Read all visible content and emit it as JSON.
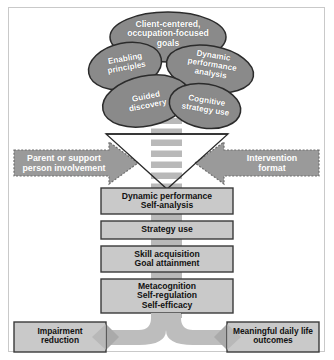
{
  "figure": {
    "colors": {
      "ellipse_fill": "#8a8a8a",
      "ellipse_stroke": "#2b2b2b",
      "box_fill": "#c9c9c9",
      "box_stroke": "#3a3a3a",
      "arrow_fill": "#9a9a9a",
      "arrow_stroke": "#6d6d6d",
      "band_fill": "#b9b9b9",
      "stripe_fill": "#ffffff",
      "frame_stroke": "#c9c9c9",
      "funnel_stroke": "#2b2b2b",
      "connector_fill": "#bdbdbd",
      "outcome_fill": "#c9c9c9",
      "text_light": "#ffffff",
      "text_dark": "#111111"
    }
  },
  "ellipses": [
    {
      "id": "client-centered-goals",
      "label": "Client-centered,\noccupation-focused\ngoals"
    },
    {
      "id": "enabling-principles",
      "label": "Enabling\nprinciples"
    },
    {
      "id": "dynamic-performance-analysis",
      "label": "Dynamic\nperformance\nanalysis"
    },
    {
      "id": "guided-discovery",
      "label": "Guided\ndiscovery"
    },
    {
      "id": "cognitive-strategy-use",
      "label": "Cognitive\nstrategy use"
    }
  ],
  "side_arrows": {
    "left": {
      "id": "parent-or-support-person-involvement",
      "label": "Parent or support\nperson involvement",
      "direction": "right"
    },
    "right": {
      "id": "intervention-format",
      "label": "Intervention\nformat",
      "direction": "left"
    }
  },
  "process_boxes": [
    {
      "id": "dynamic-performance-self-analysis",
      "label": "Dynamic performance\nSelf-analysis"
    },
    {
      "id": "strategy-use",
      "label": "Strategy use"
    },
    {
      "id": "skill-acquisition-goal-attainment",
      "label": "Skill acquisition\nGoal attainment"
    },
    {
      "id": "metacognition-self-regulation-self-efficacy",
      "label": "Metacognition\nSelf-regulation\nSelf-efficacy"
    }
  ],
  "outcomes": [
    {
      "id": "impairment-reduction",
      "label": "Impairment\nreduction"
    },
    {
      "id": "meaningful-daily-life-outcomes",
      "label": "Meaningful daily life\noutcomes"
    }
  ]
}
